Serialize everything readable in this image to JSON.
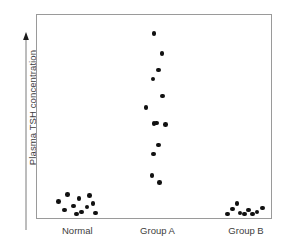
{
  "chart_data": {
    "type": "scatter",
    "title": "",
    "subtitle": "",
    "xlabel": "",
    "ylabel": "Plasma TSH concentration",
    "ylabel_arrow": "▲",
    "ylabel_arrow_direction": "up",
    "grid": false,
    "legend": null,
    "legend_position": "none",
    "axis_tick_labels_y": [],
    "ylim": [
      0,
      100
    ],
    "y_units": "arbitrary (no numeric scale shown)",
    "frame": "box",
    "marker": {
      "shape": "circle",
      "color": "#111111",
      "size_px": 4.6
    },
    "categories": [
      "Normal",
      "Group A",
      "Group B"
    ],
    "series": [
      {
        "name": "Normal",
        "category": "Normal",
        "n": 11,
        "summary": "low, tightly clustered near baseline",
        "points": [
          {
            "x": 9.2,
            "y": 8.0
          },
          {
            "x": 11.7,
            "y": 4.0
          },
          {
            "x": 13.0,
            "y": 11.5
          },
          {
            "x": 15.6,
            "y": 6.0
          },
          {
            "x": 16.8,
            "y": 2.0
          },
          {
            "x": 18.0,
            "y": 9.5
          },
          {
            "x": 19.0,
            "y": 3.0
          },
          {
            "x": 21.3,
            "y": 5.5
          },
          {
            "x": 22.5,
            "y": 11.0
          },
          {
            "x": 24.0,
            "y": 7.0
          },
          {
            "x": 25.0,
            "y": 2.5
          }
        ]
      },
      {
        "name": "Group A",
        "category": "Group A",
        "n": 13,
        "summary": "markedly elevated and widely scattered",
        "points": [
          {
            "x": 50.0,
            "y": 91.0
          },
          {
            "x": 53.5,
            "y": 81.0
          },
          {
            "x": 51.8,
            "y": 73.0
          },
          {
            "x": 49.5,
            "y": 68.5
          },
          {
            "x": 53.7,
            "y": 60.0
          },
          {
            "x": 46.6,
            "y": 54.5
          },
          {
            "x": 50.0,
            "y": 46.5
          },
          {
            "x": 54.8,
            "y": 46.0
          },
          {
            "x": 51.8,
            "y": 36.0
          },
          {
            "x": 49.8,
            "y": 31.5
          },
          {
            "x": 49.2,
            "y": 21.0
          },
          {
            "x": 52.4,
            "y": 17.5
          },
          {
            "x": 51.0,
            "y": 46.8
          }
        ]
      },
      {
        "name": "Group B",
        "category": "Group B",
        "n": 9,
        "summary": "low, tightly clustered on the baseline",
        "points": [
          {
            "x": 81.5,
            "y": 2.0
          },
          {
            "x": 83.6,
            "y": 4.5
          },
          {
            "x": 85.4,
            "y": 7.0
          },
          {
            "x": 86.8,
            "y": 2.5
          },
          {
            "x": 88.6,
            "y": 2.0
          },
          {
            "x": 90.4,
            "y": 4.0
          },
          {
            "x": 92.2,
            "y": 2.0
          },
          {
            "x": 94.0,
            "y": 3.0
          },
          {
            "x": 96.4,
            "y": 5.0
          }
        ]
      }
    ],
    "category_x_centers": [
      17.5,
      51.5,
      89.0
    ]
  },
  "axes": {
    "y_label": "Plasma TSH concentration",
    "x_tick_labels": [
      {
        "label": "Normal",
        "x_pct": 17.5
      },
      {
        "label": "Group A",
        "x_pct": 51.5
      },
      {
        "label": "Group B",
        "x_pct": 89.0
      }
    ]
  },
  "colors": {
    "marker": "#111111",
    "frame": "#9a9a9a",
    "axis_line": "#7a7a7a",
    "text": "#3d3d3d",
    "background": "#ffffff"
  }
}
